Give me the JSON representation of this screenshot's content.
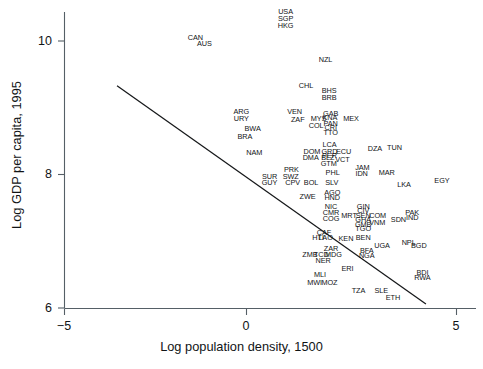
{
  "chart_data": {
    "type": "scatter",
    "title": "",
    "xlabel": "Log population density, 1500",
    "ylabel": "Log GDP per capita, 1995",
    "xlim": [
      -5.6,
      5.1
    ],
    "ylim": [
      5.75,
      10.65
    ],
    "xticks": [
      -5,
      0,
      5
    ],
    "xtick_labels": [
      "−5",
      "0",
      "5"
    ],
    "yticks": [
      6,
      8,
      10
    ],
    "ytick_labels": [
      "6",
      "8",
      "10"
    ],
    "grid": false,
    "legend": null,
    "marker_style": "text-labels",
    "point_color": "#121416",
    "axis_color": "#555f66",
    "fit_line": {
      "label": "regression line",
      "color": "#16181a",
      "x_start": -3.66,
      "y_start": 9.33,
      "x_end": 4.22,
      "y_end": 6.06
    },
    "points": [
      {
        "code": "USA",
        "x": 0.64,
        "y": 10.43
      },
      {
        "code": "SGP",
        "x": 0.64,
        "y": 10.33
      },
      {
        "code": "HKG",
        "x": 0.64,
        "y": 10.23
      },
      {
        "code": "CAN",
        "x": -1.66,
        "y": 10.05
      },
      {
        "code": "AUS",
        "x": -1.43,
        "y": 9.95
      },
      {
        "code": "NZL",
        "x": 1.66,
        "y": 9.72
      },
      {
        "code": "CHL",
        "x": 1.16,
        "y": 9.33
      },
      {
        "code": "BHS",
        "x": 1.75,
        "y": 9.25
      },
      {
        "code": "BRB",
        "x": 1.75,
        "y": 9.15
      },
      {
        "code": "ARG",
        "x": -0.49,
        "y": 8.93
      },
      {
        "code": "VEN",
        "x": 0.87,
        "y": 8.93
      },
      {
        "code": "GAB",
        "x": 1.79,
        "y": 8.9
      },
      {
        "code": "KNA",
        "x": 1.77,
        "y": 8.84
      },
      {
        "code": "MEX",
        "x": 2.31,
        "y": 8.83
      },
      {
        "code": "URY",
        "x": -0.49,
        "y": 8.83
      },
      {
        "code": "MYS",
        "x": 1.48,
        "y": 8.83
      },
      {
        "code": "ZAF",
        "x": 0.95,
        "y": 8.81
      },
      {
        "code": "PAN",
        "x": 1.79,
        "y": 8.76
      },
      {
        "code": "COL",
        "x": 1.42,
        "y": 8.73
      },
      {
        "code": "CRI",
        "x": 1.79,
        "y": 8.69
      },
      {
        "code": "BWA",
        "x": -0.2,
        "y": 8.68
      },
      {
        "code": "TTO",
        "x": 1.79,
        "y": 8.62
      },
      {
        "code": "BRA",
        "x": -0.4,
        "y": 8.56
      },
      {
        "code": "LCA",
        "x": 1.76,
        "y": 8.44
      },
      {
        "code": "DZA",
        "x": 2.92,
        "y": 8.38
      },
      {
        "code": "TUN",
        "x": 3.42,
        "y": 8.4
      },
      {
        "code": "DOM",
        "x": 1.31,
        "y": 8.34
      },
      {
        "code": "GRD",
        "x": 1.76,
        "y": 8.34
      },
      {
        "code": "ECU",
        "x": 2.12,
        "y": 8.34
      },
      {
        "code": "PER",
        "x": 1.76,
        "y": 8.27
      },
      {
        "code": "NAM",
        "x": -0.16,
        "y": 8.32
      },
      {
        "code": "DMA",
        "x": 1.28,
        "y": 8.25
      },
      {
        "code": "BLZ",
        "x": 1.72,
        "y": 8.25
      },
      {
        "code": "VCT",
        "x": 2.09,
        "y": 8.22
      },
      {
        "code": "GTM",
        "x": 1.74,
        "y": 8.16
      },
      {
        "code": "JAM",
        "x": 2.6,
        "y": 8.1
      },
      {
        "code": "MAR",
        "x": 3.22,
        "y": 8.03
      },
      {
        "code": "PRK",
        "x": 0.79,
        "y": 8.06
      },
      {
        "code": "PHL",
        "x": 1.84,
        "y": 8.03
      },
      {
        "code": "IDN",
        "x": 2.58,
        "y": 8.01
      },
      {
        "code": "SWZ",
        "x": 0.77,
        "y": 7.97
      },
      {
        "code": "SUR",
        "x": 0.23,
        "y": 7.97
      },
      {
        "code": "GUY",
        "x": 0.23,
        "y": 7.88
      },
      {
        "code": "CPV",
        "x": 0.82,
        "y": 7.88
      },
      {
        "code": "BOL",
        "x": 1.29,
        "y": 7.87
      },
      {
        "code": "SLV",
        "x": 1.82,
        "y": 7.88
      },
      {
        "code": "LKA",
        "x": 3.66,
        "y": 7.84
      },
      {
        "code": "EGY",
        "x": 4.63,
        "y": 7.9
      },
      {
        "code": "AGO",
        "x": 1.83,
        "y": 7.72
      },
      {
        "code": "ZWE",
        "x": 1.2,
        "y": 7.66
      },
      {
        "code": "HND",
        "x": 1.83,
        "y": 7.65
      },
      {
        "code": "NIC",
        "x": 1.8,
        "y": 7.52
      },
      {
        "code": "GIN",
        "x": 2.62,
        "y": 7.52
      },
      {
        "code": "CIV",
        "x": 2.62,
        "y": 7.45
      },
      {
        "code": "SEN",
        "x": 2.62,
        "y": 7.38
      },
      {
        "code": "CMR",
        "x": 1.8,
        "y": 7.43
      },
      {
        "code": "MRT",
        "x": 2.26,
        "y": 7.38
      },
      {
        "code": "COM",
        "x": 2.99,
        "y": 7.38
      },
      {
        "code": "SDN",
        "x": 3.52,
        "y": 7.32
      },
      {
        "code": "PAK",
        "x": 3.87,
        "y": 7.43
      },
      {
        "code": "IND",
        "x": 3.87,
        "y": 7.35
      },
      {
        "code": "COG",
        "x": 1.8,
        "y": 7.34
      },
      {
        "code": "GHA",
        "x": 2.62,
        "y": 7.32
      },
      {
        "code": "GMB",
        "x": 2.62,
        "y": 7.25
      },
      {
        "code": "VNM",
        "x": 2.98,
        "y": 7.27
      },
      {
        "code": "TGO",
        "x": 2.62,
        "y": 7.18
      },
      {
        "code": "CAF",
        "x": 1.62,
        "y": 7.13
      },
      {
        "code": "HTI",
        "x": 1.47,
        "y": 7.05
      },
      {
        "code": "LAO",
        "x": 1.66,
        "y": 7.05
      },
      {
        "code": "KEN",
        "x": 2.18,
        "y": 7.03
      },
      {
        "code": "BEN",
        "x": 2.62,
        "y": 7.05
      },
      {
        "code": "NPL",
        "x": 3.78,
        "y": 6.98
      },
      {
        "code": "BGD",
        "x": 4.04,
        "y": 6.93
      },
      {
        "code": "UGA",
        "x": 3.1,
        "y": 6.93
      },
      {
        "code": "ZAR",
        "x": 1.8,
        "y": 6.88
      },
      {
        "code": "BFA",
        "x": 2.71,
        "y": 6.85
      },
      {
        "code": "NGA",
        "x": 2.71,
        "y": 6.78
      },
      {
        "code": "ZMB",
        "x": 1.26,
        "y": 6.79
      },
      {
        "code": "TCD",
        "x": 1.55,
        "y": 6.79
      },
      {
        "code": "MDG",
        "x": 1.86,
        "y": 6.79
      },
      {
        "code": "NER",
        "x": 1.6,
        "y": 6.7
      },
      {
        "code": "ERI",
        "x": 2.22,
        "y": 6.59
      },
      {
        "code": "BDI",
        "x": 4.13,
        "y": 6.53
      },
      {
        "code": "RWA",
        "x": 4.13,
        "y": 6.45
      },
      {
        "code": "MLI",
        "x": 1.52,
        "y": 6.5
      },
      {
        "code": "MWI",
        "x": 1.38,
        "y": 6.38
      },
      {
        "code": "MOZ",
        "x": 1.76,
        "y": 6.38
      },
      {
        "code": "TZA",
        "x": 2.5,
        "y": 6.25
      },
      {
        "code": "SLE",
        "x": 3.08,
        "y": 6.25
      },
      {
        "code": "ETH",
        "x": 3.38,
        "y": 6.15
      }
    ]
  }
}
